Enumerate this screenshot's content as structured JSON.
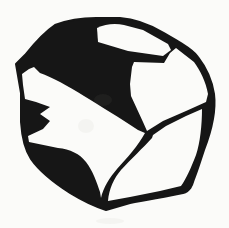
{
  "figure": {
    "alt": "Black and white hand-drawn clip-art of a faceted rock or boulder with a thick irregular outline, a white top facet, a broad black shaded band sweeping from upper left to center, white side facets and a heavy black lower-left shadow mass"
  },
  "colors": {
    "ink": "#161616",
    "paper": "#fbfbf9"
  },
  "paths": {
    "silhouette": "M 55,25 C 68,20 82,18 96,18 L 120,18 C 135,19 152,26 164,33 L 176,40 C 185,46 193,50 198,57 C 205,66 212,80 214,94 C 216,110 211,132 204,150 C 200,162 197,172 194,179 C 192,186 190,191 183,193 C 166,197 148,199 130,203 L 106,210 C 96,207 83,201 70,193 C 56,184 40,172 31,159 C 25,150 22,137 21,122 L 21,93 L 16,64 L 25,55 C 33,45 43,33 55,25 Z",
    "top_facet": "M 97,28 C 105,24 115,23 124,25 L 143,30 L 168,44 L 171,50 L 163,56 L 128,51 L 98,42 Z",
    "right_facet": "M 134,62 L 164,63 L 170,53 L 176,48 L 194,62 C 200,70 206,82 208,94 L 206,102 L 186,111 L 163,121 L 147,131 L 143,122 L 131,96 L 130,84 L 132,67 Z",
    "middle_facet": "M 40,73 C 52,77 68,86 84,96 C 100,106 120,118 138,130 L 145,133 C 138,146 127,158 117,169 C 110,177 103,188 101,198 L 100,192 C 97,183 93,171 86,162 C 80,154 70,149 58,148 L 29,142 L 28,136 L 43,129 L 50,121 L 40,114 L 50,107 L 36,102 L 25,99 L 23,85 L 22,74 L 29,69 L 34,67 Z",
    "bottom_right_facet": "M 152,138 C 143,148 131,159 121,170 C 114,178 109,189 108,201 L 130,197 L 160,191 L 181,186 C 186,179 191,168 196,155 C 200,143 202,125 202,109 L 186,116 L 166,126 L 153,135 Z"
  }
}
